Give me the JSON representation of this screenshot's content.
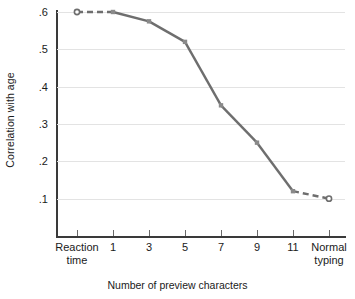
{
  "chart_data": {
    "type": "line",
    "title": "",
    "xlabel": "Number of preview characters",
    "ylabel": "Correlation with age",
    "categories": [
      "Reaction\ntime",
      "1",
      "3",
      "5",
      "7",
      "9",
      "11",
      "Normal\ntyping"
    ],
    "values": [
      0.6,
      0.6,
      0.575,
      0.52,
      0.35,
      0.25,
      0.12,
      0.1
    ],
    "ylim": [
      0.0,
      0.6
    ],
    "ytick_labels": [
      ".6",
      ".5",
      ".4",
      ".3",
      ".2",
      ".1"
    ],
    "ytick_values": [
      0.6,
      0.5,
      0.4,
      0.3,
      0.2,
      0.1
    ],
    "grid": true,
    "legend": "none",
    "series": [
      {
        "name": "Correlation with age",
        "values": [
          0.6,
          0.6,
          0.575,
          0.52,
          0.35,
          0.25,
          0.12,
          0.1
        ],
        "color": "#6e6e6e",
        "marker": "square",
        "segment_styles": [
          "dashed",
          "solid",
          "solid",
          "solid",
          "solid",
          "solid",
          "dashed"
        ]
      }
    ]
  },
  "axes": {
    "y_axis_label": "Correlation with age",
    "x_axis_label": "Number of preview characters",
    "y_ticks": [
      {
        "label": ".6",
        "value": 0.6
      },
      {
        "label": ".5",
        "value": 0.5
      },
      {
        "label": ".4",
        "value": 0.4
      },
      {
        "label": ".3",
        "value": 0.3
      },
      {
        "label": ".2",
        "value": 0.2
      },
      {
        "label": ".1",
        "value": 0.1
      }
    ],
    "x_ticks": [
      {
        "label": "Reaction\ntime",
        "index": 0
      },
      {
        "label": "1",
        "index": 1
      },
      {
        "label": "3",
        "index": 2
      },
      {
        "label": "5",
        "index": 3
      },
      {
        "label": "7",
        "index": 4
      },
      {
        "label": "9",
        "index": 5
      },
      {
        "label": "11",
        "index": 6
      },
      {
        "label": "Normal\ntyping",
        "index": 7
      }
    ]
  },
  "colors": {
    "line": "#6e6e6e",
    "marker": "#8a8a8a",
    "grid": "#e3e3e3",
    "axis": "#3a3a3a",
    "text": "#1a1a1a",
    "background": "#ffffff"
  }
}
